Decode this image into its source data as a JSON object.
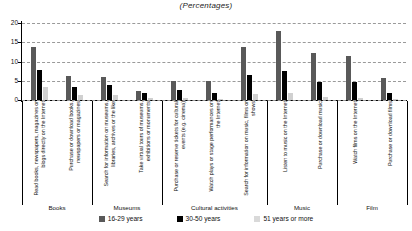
{
  "chart_data": {
    "type": "bar",
    "title": "(Percentages)",
    "xlabel": "",
    "ylabel": "",
    "ylim": [
      0,
      20
    ],
    "yticks": [
      0,
      5,
      10,
      15,
      20
    ],
    "grid": true,
    "legend_position": "bottom",
    "categories": [
      "Read books, newspapers, magazines or blogs directly on the Internet",
      "Purchase or download books, newspapers or magazines",
      "Search for information on museums, libraries, archives or the like",
      "Take virtual tours of museums, exhibitions or monuments",
      "Purchase or reserve tickets for cultural events (e.g. cinema)",
      "Watch plays or stage performances on the Internet",
      "Search for information on music, films or shows",
      "Listen to music on the Internet",
      "Purchase or download music",
      "Watch films on the Internet",
      "Purchase or download films"
    ],
    "series": [
      {
        "name": "16-29 years",
        "color": "#595959",
        "values": [
          13.9,
          6.2,
          5.9,
          2.4,
          4.9,
          4.9,
          13.9,
          17.8,
          12.2,
          11.5,
          5.6
        ]
      },
      {
        "name": "30-50 years",
        "color": "#000000",
        "values": [
          7.9,
          3.3,
          4.0,
          1.7,
          2.6,
          1.9,
          6.4,
          7.5,
          4.8,
          4.8,
          1.9
        ]
      },
      {
        "name": "51 years or more",
        "color": "#d9d9d9",
        "values": [
          3.4,
          1.2,
          1.3,
          0.4,
          0.5,
          0.3,
          1.5,
          1.7,
          0.7,
          0.6,
          0.2
        ]
      }
    ],
    "groups": [
      {
        "label": "Books",
        "categories": [
          0,
          1
        ]
      },
      {
        "label": "Museums",
        "categories": [
          2,
          3
        ]
      },
      {
        "label": "Cultural activities",
        "categories": [
          4,
          5,
          6
        ]
      },
      {
        "label": "Music",
        "categories": [
          7,
          8
        ]
      },
      {
        "label": "Film",
        "categories": [
          9,
          10
        ]
      }
    ]
  }
}
